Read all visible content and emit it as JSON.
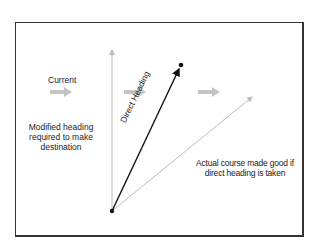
{
  "diagram": {
    "labels": {
      "current": "Current",
      "modified_heading": "Modified heading required to make destination",
      "direct_heading": "Direct Heading",
      "actual_course": "Actual course made good if direct heading is taken"
    },
    "colors": {
      "frame": "#333333",
      "direct_heading_line": "#111111",
      "gray_lines": "#bbbbbb",
      "current_arrows": "#c4c4c4"
    },
    "elements": {
      "origin_point": {
        "x": 112,
        "y": 211
      },
      "destination_point": {
        "x": 181,
        "y": 65
      },
      "modified_heading_vector_end": {
        "x": 112,
        "y": 48
      },
      "actual_course_vector_end": {
        "x": 253,
        "y": 96
      },
      "current_arrows": [
        {
          "x": 62,
          "y": 92
        },
        {
          "x": 137,
          "y": 92
        },
        {
          "x": 212,
          "y": 92
        }
      ]
    }
  }
}
